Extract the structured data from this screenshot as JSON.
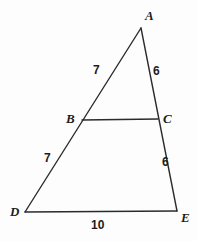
{
  "figure": {
    "type": "geometry-diagram",
    "background_color": "#fdfdfd",
    "stroke_color": "#2b2b2b",
    "text_color": "#1c1c1c"
  },
  "vertices": [
    {
      "name": "A",
      "label": "A",
      "x": 141,
      "y": 28,
      "label_x": 145,
      "label_y": 9
    },
    {
      "name": "B",
      "label": "B",
      "x": 82,
      "y": 120,
      "label_x": 66,
      "label_y": 112
    },
    {
      "name": "C",
      "label": "C",
      "x": 158,
      "y": 119,
      "label_x": 163,
      "label_y": 112
    },
    {
      "name": "D",
      "label": "D",
      "x": 25,
      "y": 212,
      "label_x": 10,
      "label_y": 205
    },
    {
      "name": "E",
      "label": "E",
      "x": 177,
      "y": 211,
      "label_x": 181,
      "label_y": 211
    }
  ],
  "segments": [
    {
      "name": "side-AD",
      "from": "A",
      "to": "D"
    },
    {
      "name": "side-AE",
      "from": "A",
      "to": "E"
    },
    {
      "name": "segment-BC",
      "from": "B",
      "to": "C"
    },
    {
      "name": "base-DE",
      "from": "D",
      "to": "E"
    }
  ],
  "measures": [
    {
      "name": "AB",
      "value": "7",
      "x": 93,
      "y": 64
    },
    {
      "name": "AC",
      "value": "6",
      "x": 153,
      "y": 65
    },
    {
      "name": "BD",
      "value": "7",
      "x": 44,
      "y": 152
    },
    {
      "name": "CE",
      "value": "6",
      "x": 162,
      "y": 156
    },
    {
      "name": "DE",
      "value": "10",
      "x": 91,
      "y": 219
    }
  ]
}
